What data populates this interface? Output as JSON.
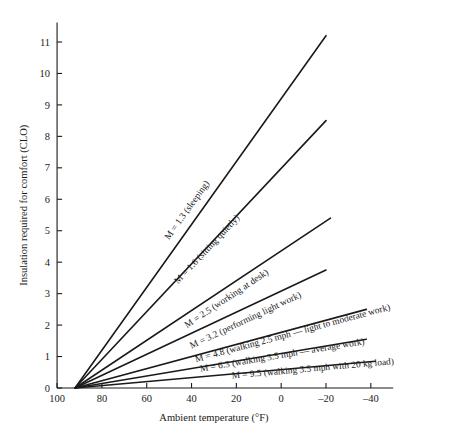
{
  "chart_data": {
    "type": "line",
    "title": "",
    "xlabel": "Ambient temperature (°F)",
    "ylabel": "Insulation required for comfort (CLO)",
    "xlim": [
      100,
      -50
    ],
    "ylim": [
      0,
      11.6
    ],
    "xticks": [
      100,
      80,
      60,
      40,
      20,
      0,
      -20,
      -40
    ],
    "xticklabels": [
      "100",
      "80",
      "60",
      "40",
      "20",
      "0",
      "–20",
      "–40"
    ],
    "yticks": [
      0,
      1,
      2,
      3,
      4,
      5,
      6,
      7,
      8,
      9,
      10,
      11
    ],
    "yticklabels": [
      "0",
      "1",
      "2",
      "3",
      "4",
      "5",
      "6",
      "7",
      "8",
      "9",
      "10",
      "11"
    ],
    "grid": false,
    "legend": "inline-labels",
    "x_axis_reversed": true,
    "convergence_point": {
      "x": 92,
      "y": 0
    },
    "series": [
      {
        "name": "M = 1.3 (sleeping)",
        "label": "M = 1.3 (sleeping)",
        "metabolic_rate": 1.3,
        "x": [
          92,
          -20
        ],
        "y": [
          0,
          11.2
        ],
        "label_at": {
          "x": 50,
          "y": 4.7
        }
      },
      {
        "name": "M = 1.6 (sitting quietly)",
        "label": "M = 1.6 (sitting quietly)",
        "metabolic_rate": 1.6,
        "x": [
          92,
          -20
        ],
        "y": [
          0,
          8.5
        ],
        "label_at": {
          "x": 46,
          "y": 3.3
        }
      },
      {
        "name": "M = 2.5 (working at desk)",
        "label": "M = 2.5 (working at desk)",
        "metabolic_rate": 2.5,
        "x": [
          92,
          -22
        ],
        "y": [
          0,
          5.4
        ],
        "label_at": {
          "x": 42,
          "y": 1.9
        }
      },
      {
        "name": "M = 3.2 (performing light work)",
        "label": "M = 3.2 (performing light work)",
        "metabolic_rate": 3.2,
        "x": [
          92,
          -20
        ],
        "y": [
          0,
          3.75
        ],
        "label_at": {
          "x": 40,
          "y": 1.25
        }
      },
      {
        "name": "M = 4.8 (walking 2.5 mph — light to moderate work)",
        "label": "M = 4.8 (walking 2.5 mph — light to moderate work)",
        "metabolic_rate": 4.8,
        "x": [
          92,
          -38
        ],
        "y": [
          0,
          2.5
        ],
        "label_at": {
          "x": 38,
          "y": 0.82
        }
      },
      {
        "name": "M = 6.3 (walking 3.5 mph — average work)",
        "label": "M = 6.3 (walking 3.5 mph — average work)",
        "metabolic_rate": 6.3,
        "x": [
          92,
          -38
        ],
        "y": [
          0,
          1.55
        ],
        "label_at": {
          "x": 36,
          "y": 0.52
        }
      },
      {
        "name": "M = 9.5 (walking 3.5 mph with 20 kg load)",
        "label": "M = 9.5 (walking 3.5 mph with 20 kg load)",
        "metabolic_rate": 9.5,
        "x": [
          92,
          -42
        ],
        "y": [
          0,
          0.85
        ],
        "label_at": {
          "x": 22,
          "y": 0.3
        }
      }
    ]
  }
}
